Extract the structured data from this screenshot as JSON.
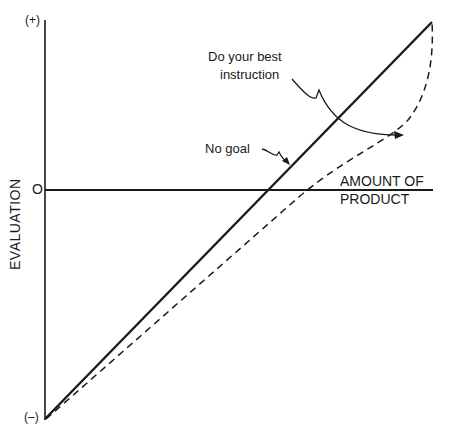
{
  "diagram": {
    "y_axis": {
      "title": "EVALUATION",
      "top_label": "(+)",
      "zero_label": "O",
      "bottom_label": "(–)"
    },
    "x_axis": {
      "title_line1": "AMOUNT  OF",
      "title_line2": "PRODUCT"
    },
    "curves": [
      {
        "name": "No goal",
        "style": "solid",
        "shape": "linear"
      },
      {
        "name": "Do your best instruction",
        "style": "dashed",
        "shape": "convex, rising steeply at high product"
      }
    ],
    "annotations": {
      "no_goal": "No goal",
      "do_your_best_line1": "Do your best",
      "do_your_best_line2": "instruction"
    },
    "colors": {
      "ink": "#1a1a1a",
      "background": "#ffffff"
    }
  }
}
